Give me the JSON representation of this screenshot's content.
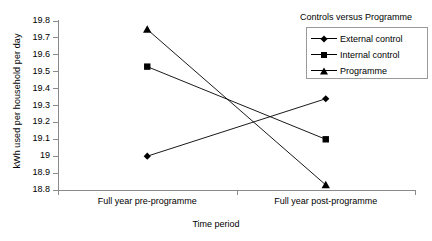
{
  "chart_data": {
    "type": "line",
    "title": "",
    "xlabel": "Time period",
    "ylabel": "kWh used per household per day",
    "categories": [
      "Full year pre-programme",
      "Full year post-programme"
    ],
    "ylim": [
      18.8,
      19.8
    ],
    "yticks": [
      "19.8",
      "19.7",
      "19.6",
      "19.5",
      "19.4",
      "19.3",
      "19.2",
      "19.1",
      "19",
      "18.9",
      "18.8"
    ],
    "ytick_values": [
      19.8,
      19.7,
      19.6,
      19.5,
      19.4,
      19.3,
      19.2,
      19.1,
      19.0,
      18.9,
      18.8
    ],
    "grid": false,
    "legend_position": "top-right",
    "legend_title": "Controls versus Programme",
    "series": [
      {
        "name": "External control",
        "marker": "diamond",
        "values": [
          19.0,
          19.34
        ]
      },
      {
        "name": "Internal control",
        "marker": "square",
        "values": [
          19.53,
          19.1
        ]
      },
      {
        "name": "Programme",
        "marker": "triangle",
        "values": [
          19.75,
          18.83
        ]
      }
    ],
    "colors": {
      "line": "#000000",
      "marker": "#000000",
      "axis": "#8a8a8a",
      "background": "#ffffff"
    }
  }
}
